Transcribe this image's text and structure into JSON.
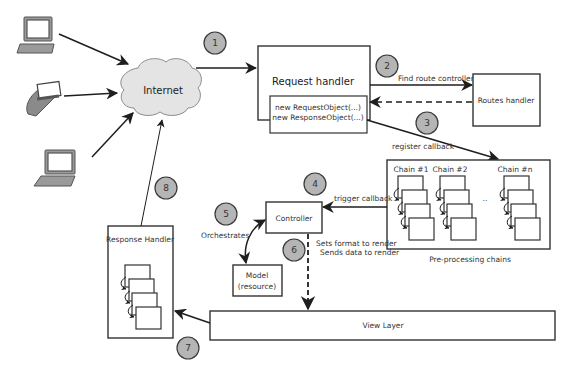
{
  "diagram": {
    "type": "request-lifecycle-architecture",
    "clients": [
      {
        "name": "laptop-top",
        "icon": "laptop-icon"
      },
      {
        "name": "handheld-pda",
        "icon": "pda-icon"
      },
      {
        "name": "laptop-bottom",
        "icon": "laptop-icon"
      }
    ],
    "internet": {
      "label": "Internet"
    },
    "request_handler": {
      "title": "Request handler",
      "line1": "new RequestObject(...)",
      "line2": "new ResponseObject(...)"
    },
    "routes_handler": {
      "label": "Routes handler"
    },
    "preprocessing": {
      "caption": "Pre-processing chains",
      "chains": [
        {
          "label": "Chain #1"
        },
        {
          "label": "Chain #2"
        },
        {
          "label": "Chain #n"
        }
      ],
      "ellipsis": ".."
    },
    "controller": {
      "label": "Controller"
    },
    "model": {
      "line1": "Model",
      "line2": "(resource)"
    },
    "view_layer": {
      "label": "View Layer"
    },
    "response_handler": {
      "label": "Response Handler"
    },
    "edges": {
      "find_route": "Find route controller",
      "register_callback": "register callback",
      "trigger_callback": "trigger callback",
      "orchestrates": "Orchestrates",
      "sets_format": "Sets format to render",
      "sends_data": "Sends data to render"
    },
    "steps": [
      "1",
      "2",
      "3",
      "4",
      "5",
      "6",
      "7",
      "8"
    ]
  }
}
